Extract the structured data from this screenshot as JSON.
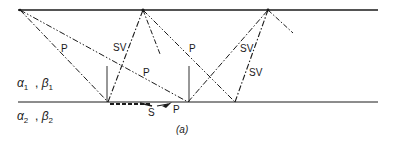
{
  "diagram": {
    "caption": "(a)",
    "layers": {
      "upper": {
        "alpha": "α",
        "alpha_sub": "1",
        "sep": ",",
        "beta": "β",
        "beta_sub": "1"
      },
      "lower": {
        "alpha": "α",
        "alpha_sub": "2",
        "sep": ",",
        "beta": "β",
        "beta_sub": "2"
      }
    },
    "ray_labels": {
      "p_left": "P",
      "sv_left": "SV",
      "p_mid": "P",
      "p_right_top": "P",
      "sv_right_upper": "SV",
      "sv_right_lower": "SV",
      "s_interface": "S",
      "p_interface": "P"
    },
    "colors": {
      "line": "#1a1a1a",
      "background": "#ffffff"
    }
  }
}
